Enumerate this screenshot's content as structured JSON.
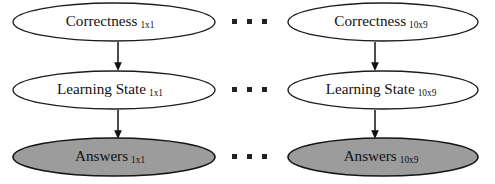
{
  "diagram": {
    "type": "graphical-model",
    "background_color": "#ffffff",
    "stroke_color": "#111111",
    "shaded_fill_color": "#9c9c9c",
    "unshaded_fill_color": "#ffffff",
    "columns": [
      {
        "id": "column-1x1",
        "index_label": "1x1",
        "nodes": [
          {
            "id": "correctness-1x1",
            "label": "Correctness",
            "subscript": "1x1",
            "shaded": false,
            "row": "correctness"
          },
          {
            "id": "learning-state-1x1",
            "label": "Learning State",
            "subscript": "1x1",
            "shaded": false,
            "row": "learning-state"
          },
          {
            "id": "answers-1x1",
            "label": "Answers",
            "subscript": "1x1",
            "shaded": true,
            "row": "answers"
          }
        ],
        "edges": [
          {
            "id": "edge-correctness-to-learning-state-1x1",
            "from": "correctness-1x1",
            "to": "learning-state-1x1"
          },
          {
            "id": "edge-learning-state-to-answers-1x1",
            "from": "learning-state-1x1",
            "to": "answers-1x1"
          }
        ]
      },
      {
        "id": "column-10x9",
        "index_label": "10x9",
        "nodes": [
          {
            "id": "correctness-10x9",
            "label": "Correctness",
            "subscript": "10x9",
            "shaded": false,
            "row": "correctness"
          },
          {
            "id": "learning-state-10x9",
            "label": "Learning State",
            "subscript": "10x9",
            "shaded": false,
            "row": "learning-state"
          },
          {
            "id": "answers-10x9",
            "label": "Answers",
            "subscript": "10x9",
            "shaded": true,
            "row": "answers"
          }
        ],
        "edges": [
          {
            "id": "edge-correctness-to-learning-state-10x9",
            "from": "correctness-10x9",
            "to": "learning-state-10x9"
          },
          {
            "id": "edge-learning-state-to-answers-10x9",
            "from": "learning-state-10x9",
            "to": "answers-10x9"
          }
        ]
      }
    ],
    "ellipses_separators": [
      {
        "id": "ellipsis-row-correctness",
        "row": "correctness",
        "dot_count": 3
      },
      {
        "id": "ellipsis-row-learning-state",
        "row": "learning-state",
        "dot_count": 3
      },
      {
        "id": "ellipsis-row-answers",
        "row": "answers",
        "dot_count": 3
      }
    ]
  }
}
